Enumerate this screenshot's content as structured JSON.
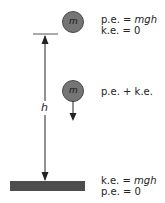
{
  "diagram": {
    "height_label": "h",
    "mass_label": "m",
    "states": [
      {
        "position": "top",
        "line1_prefix": "p.e. = ",
        "line1_var": "mgh",
        "line2": "k.e. = 0"
      },
      {
        "position": "middle",
        "line1": "p.e. + k.e."
      },
      {
        "position": "bottom",
        "line1_prefix": "k.e. = ",
        "line1_var": "mgh",
        "line2": "p.e. = 0"
      }
    ],
    "colors": {
      "mass_fill": "#757575",
      "mass_stroke": "#4a4a4a",
      "ground": "#4d4d4d",
      "lines": "#222222"
    }
  }
}
